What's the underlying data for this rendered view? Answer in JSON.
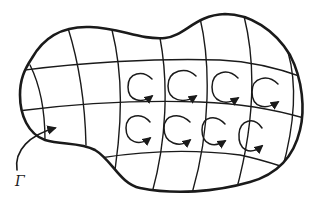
{
  "diagram": {
    "boundary_label": "Γ",
    "colors": {
      "ink": "#1a1a1a",
      "background": "#ffffff"
    },
    "circulation_cells": {
      "rows": 2,
      "cols": 4,
      "direction": "counterclockwise"
    }
  }
}
